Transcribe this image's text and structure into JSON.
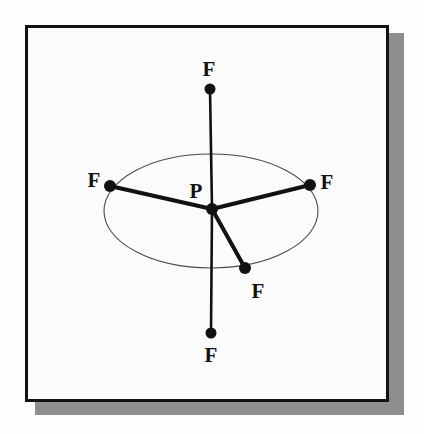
{
  "figure": {
    "frame": {
      "border_color": "#111111",
      "background_color": "#fbfbfb",
      "shadow_color": "#8e8e8e"
    },
    "center_atom": {
      "id": "P",
      "label": "P",
      "x": 212,
      "y": 209,
      "label_x": 196,
      "label_y": 191,
      "dot_radius": 6
    },
    "ligands": [
      {
        "id": "F-axial-top",
        "label": "F",
        "x": 210,
        "y": 89,
        "label_x": 209,
        "label_y": 69,
        "dot_radius": 5.5,
        "bond_type": "axial",
        "bond_width": 2.6
      },
      {
        "id": "F-equatorial-left",
        "label": "F",
        "x": 110,
        "y": 186,
        "label_x": 94,
        "label_y": 180,
        "dot_radius": 6,
        "bond_type": "equatorial",
        "bond_width": 4
      },
      {
        "id": "F-equatorial-right",
        "label": "F",
        "x": 310,
        "y": 185,
        "label_x": 327,
        "label_y": 182,
        "dot_radius": 6,
        "bond_type": "equatorial",
        "bond_width": 4
      },
      {
        "id": "F-equatorial-front",
        "label": "F",
        "x": 245,
        "y": 268,
        "label_x": 258,
        "label_y": 291,
        "dot_radius": 6,
        "bond_type": "equatorial",
        "bond_width": 4
      },
      {
        "id": "F-axial-bottom",
        "label": "F",
        "x": 211,
        "y": 333,
        "label_x": 211,
        "label_y": 355,
        "dot_radius": 5.5,
        "bond_type": "axial",
        "bond_width": 2.6
      }
    ],
    "equatorial_plane_ellipse": {
      "cx": 211,
      "cy": 211,
      "rx": 107,
      "ry": 57,
      "stroke_color": "#4a4a4a",
      "stroke_width": 1.1
    },
    "colors": {
      "atom_fill": "#111111",
      "bond_stroke": "#111111",
      "ellipse_stroke": "#4a4a4a"
    }
  }
}
